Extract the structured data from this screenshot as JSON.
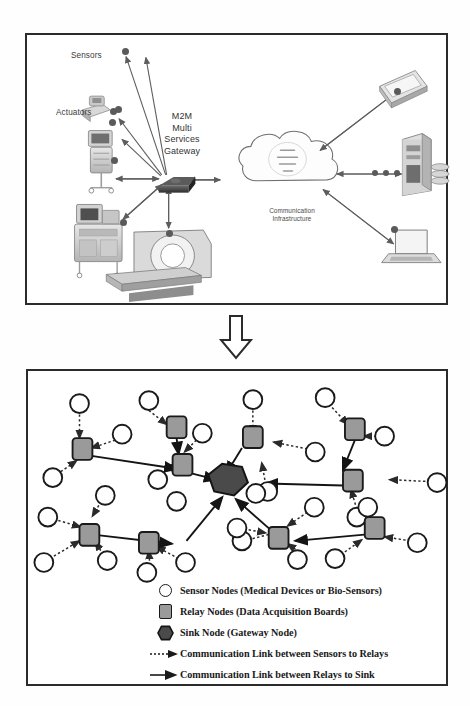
{
  "figure": {
    "top_panel": {
      "labels": {
        "sensors": "Sensors",
        "actuators": "Actuators",
        "gateway": "M2M\nMulti\nServices\nGateway",
        "infrastructure": "Communication\nInfrastructure"
      },
      "devices": [
        {
          "name": "infusion-pump",
          "side": "left"
        },
        {
          "name": "vital-signs-monitor-cart",
          "side": "left"
        },
        {
          "name": "anesthesia-machine",
          "side": "left"
        },
        {
          "name": "ct-scanner",
          "side": "left"
        },
        {
          "name": "smartphone",
          "side": "right"
        },
        {
          "name": "server-tower-with-storage",
          "side": "right"
        },
        {
          "name": "laptop",
          "side": "right"
        }
      ]
    },
    "flow_arrow": {
      "direction": "down"
    },
    "bottom_panel": {
      "node_counts": {
        "sensor_nodes": 30,
        "relay_nodes": 10,
        "sink_nodes": 1
      }
    },
    "legend": {
      "items": [
        {
          "icon": "sensor-node-circle",
          "label": "Sensor Nodes (Medical Devices or Bio-Sensors)"
        },
        {
          "icon": "relay-node-square",
          "label": "Relay Nodes (Data Acquisition Boards)"
        },
        {
          "icon": "sink-node-hexagon",
          "label": "Sink Node (Gateway Node)"
        },
        {
          "icon": "dotted-arrow",
          "label": "Communication Link between Sensors to Relays"
        },
        {
          "icon": "solid-arrow",
          "label": "Communication Link between Relays to Sink"
        }
      ]
    },
    "colors": {
      "frame": "#2b2b2b",
      "sensor_fill": "#ffffff",
      "relay_fill": "#9a9a9a",
      "sink_fill": "#4a4a4a",
      "link_solid": "#1a1a1a",
      "link_dotted": "#3a3a3a",
      "label_text": "#3a3a3a"
    }
  }
}
